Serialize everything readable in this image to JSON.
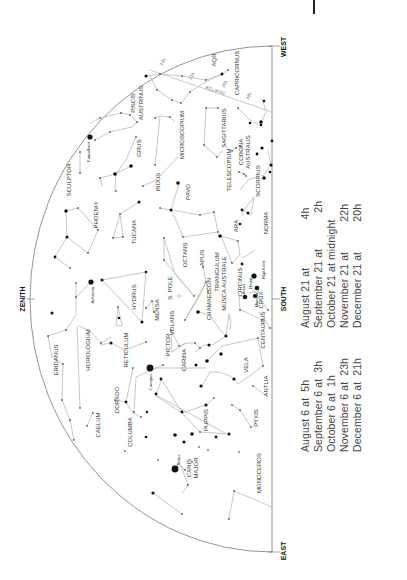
{
  "directions": {
    "zenith": "ZENITH",
    "south": "SOUTH",
    "west": "WEST",
    "east": "EAST",
    "south_pole": "S. POLE",
    "ecliptic": "ECLIPTIC"
  },
  "constellations": [
    "ERIDANUS",
    "HOROLOGIUM",
    "CAELUM",
    "DORADO",
    "RETICULUM",
    "HYDRUS",
    "PHOENIX",
    "SCULPTOR",
    "TUCANA",
    "GRUS",
    "PISCIS AUSTRINUS",
    "INDUS",
    "PAVO",
    "MICROSCOPIUM",
    "OCTANS",
    "APUS",
    "MENSA",
    "VOLANS",
    "CHAMAELEON",
    "TRIANGULUM AUSTRALE",
    "CIRCINUS",
    "ARA",
    "NORMA",
    "TELESCOPIUM",
    "CORONA AUSTRALIS",
    "SAGITTARIUS",
    "SCORPIUS",
    "CAPRICORNUS",
    "AQR",
    "MUSCA",
    "CRUX",
    "CENTAURUS",
    "PICTOR",
    "CARINA",
    "VELA",
    "ANTLIA",
    "PUPPIS",
    "PYXIS",
    "COLUMBA",
    "CANIS MAJOR",
    "MONOCEROS"
  ],
  "stars": [
    "Achernar",
    "Fomalhaut",
    "Canopus",
    "Sirius",
    "Acrux",
    "Mimosa",
    "Hadar",
    "Rigil Kent"
  ],
  "ecliptic_marks": [
    "22h",
    "21h",
    "20h",
    "19h"
  ],
  "observing_times": {
    "left_column": [
      {
        "date": "August 6 at",
        "time": "5h"
      },
      {
        "date": "September 6 at",
        "time": "3h"
      },
      {
        "date": "October 6 at",
        "time": "1h"
      },
      {
        "date": "November 6 at",
        "time": "23h"
      },
      {
        "date": "December 6 at",
        "time": "21h"
      }
    ],
    "right_column": [
      {
        "date": "August 21 at",
        "time": "4h"
      },
      {
        "date": "September 21 at",
        "time": "2h"
      },
      {
        "date": "October 21 at midnight",
        "time": ""
      },
      {
        "date": "November 21 at",
        "time": "22h"
      },
      {
        "date": "December 21 at",
        "time": "20h"
      }
    ]
  },
  "colors": {
    "line": "#b8b8b8",
    "star": "#111111",
    "outline": "#555555",
    "text": "#444444"
  }
}
